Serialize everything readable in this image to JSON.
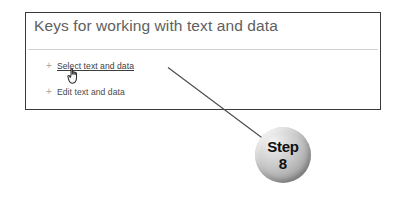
{
  "panel": {
    "title": "Keys for working with text and data",
    "items": [
      {
        "expander": "+",
        "label": "Select text and data",
        "state": "link-underlined"
      },
      {
        "expander": "+",
        "label": "Edit text and data",
        "state": "link"
      }
    ]
  },
  "cursor": {
    "icon": "hand-pointer-cursor",
    "over_item": "Select text and data"
  },
  "callout": {
    "word": "Step",
    "number": "8",
    "shape": "sphere"
  },
  "colors": {
    "page_background": "#ffffff",
    "panel_border": "#3a3a3a",
    "panel_background": "#ffffff",
    "title_text": "#606060",
    "divider": "#d2d2d2",
    "expander": "#a8a8a8",
    "link_text": "#3d3d3d",
    "leader_line": "#4a4a4a",
    "callout_text": "#101010",
    "callout_light": "#f2f2f2",
    "callout_dark": "#7c7c7c"
  }
}
